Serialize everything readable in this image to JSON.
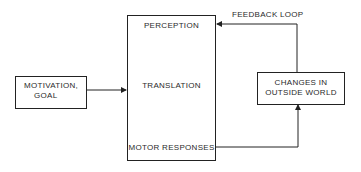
{
  "diagram": {
    "type": "block-flow",
    "nodes": {
      "motivation": {
        "line1": "MOTIVATION,",
        "line2": "GOAL"
      },
      "process": {
        "perception": "PERCEPTION",
        "translation": "TRANSLATION",
        "motor": "MOTOR RESPONSES"
      },
      "outside": {
        "line1": "CHANGES IN",
        "line2": "OUTSIDE WORLD"
      }
    },
    "edges": [
      {
        "from": "MOTIVATION, GOAL",
        "to": "PERCEPTION/TRANSLATION/MOTOR RESPONSES box"
      },
      {
        "from": "PERCEPTION",
        "to": "TRANSLATION"
      },
      {
        "from": "TRANSLATION",
        "to": "MOTOR RESPONSES"
      },
      {
        "from": "MOTOR RESPONSES",
        "to": "CHANGES IN OUTSIDE WORLD"
      },
      {
        "from": "CHANGES IN OUTSIDE WORLD",
        "to": "PERCEPTION",
        "label": "FEEDBACK LOOP"
      }
    ],
    "feedback_label": "FEEDBACK LOOP",
    "colors": {
      "line": "#222222",
      "text": "#2a2a2a",
      "background": "#ffffff"
    }
  }
}
